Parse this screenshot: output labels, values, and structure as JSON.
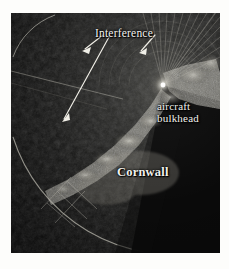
{
  "figure": {
    "type": "radar-ppi-photograph",
    "background_color": "#ffffff",
    "plate_color": "#0b0b0b",
    "annotation_color": "#f2f2ee"
  },
  "annotations": {
    "interference": {
      "label": "Interference",
      "arrows": 2
    },
    "bulkhead": {
      "line1": "aircraft",
      "line2": "bulkhead"
    },
    "cornwall": {
      "label": "Cornwall"
    }
  },
  "display": {
    "sweep_origin_label": "radar-origin",
    "shadow_sector_label": "bulkhead-shadow-sector",
    "range_ring_label": "range-ring",
    "graticule_label": "range-graticule"
  }
}
